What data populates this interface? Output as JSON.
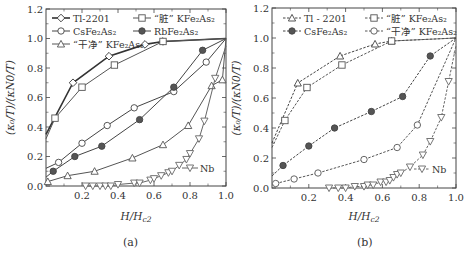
{
  "chart_data": [
    {
      "panel": "(a)",
      "type": "line",
      "line_style": "solid",
      "xlabel": "H/H_c2",
      "ylabel": "(κ0/T)/(κN0/T)",
      "xlim": [
        0,
        1.0
      ],
      "ylim": [
        0,
        1.2
      ],
      "xticks": [
        "0.2",
        "0.4",
        "0.6",
        "0.8",
        "1.0"
      ],
      "yticks": [
        "0.0",
        "0.2",
        "0.4",
        "0.6",
        "0.8",
        "1.0",
        "1.2"
      ],
      "legend_position": "upper left",
      "series": [
        {
          "name": "Tl-2201",
          "marker": "diamond",
          "filled": false,
          "color": "#333333",
          "weight": 1.6,
          "x": [
            0.0,
            0.15,
            0.35,
            0.55,
            0.65,
            1.0
          ],
          "y": [
            0.35,
            0.7,
            0.88,
            0.96,
            0.98,
            1.0
          ]
        },
        {
          "name": "“脏” KFe2As2",
          "marker": "square",
          "filled": false,
          "color": "#555555",
          "weight": 1.0,
          "x": [
            0.0,
            0.05,
            0.2,
            0.38,
            0.65,
            1.0
          ],
          "y": [
            0.32,
            0.46,
            0.67,
            0.82,
            0.98,
            1.0
          ]
        },
        {
          "name": "CsFe2As2",
          "marker": "circle",
          "filled": false,
          "color": "#444444",
          "weight": 1.0,
          "x": [
            0.0,
            0.07,
            0.2,
            0.34,
            0.49,
            0.71,
            0.89,
            1.0
          ],
          "y": [
            0.12,
            0.16,
            0.29,
            0.41,
            0.53,
            0.64,
            0.84,
            1.0
          ]
        },
        {
          "name": "RbFe2As2",
          "marker": "circle",
          "filled": true,
          "color": "#444444",
          "weight": 1.0,
          "x": [
            0.0,
            0.04,
            0.16,
            0.31,
            0.52,
            0.71,
            0.87,
            1.0
          ],
          "y": [
            0.06,
            0.1,
            0.2,
            0.27,
            0.45,
            0.67,
            0.92,
            1.0
          ]
        },
        {
          "name": "“干净” KFe2As2",
          "marker": "triangle-up",
          "filled": false,
          "color": "#555555",
          "weight": 1.0,
          "x": [
            0.0,
            0.01,
            0.12,
            0.27,
            0.48,
            0.65,
            0.79,
            0.92,
            0.98,
            1.0
          ],
          "y": [
            0.02,
            0.03,
            0.07,
            0.1,
            0.19,
            0.28,
            0.41,
            0.68,
            0.72,
            1.0
          ]
        },
        {
          "name": "Nb",
          "marker": "triangle-down",
          "filled": false,
          "color": "#666666",
          "weight": 1.0,
          "x": [
            0.22,
            0.26,
            0.3,
            0.33,
            0.36,
            0.4,
            0.49,
            0.52,
            0.58,
            0.6,
            0.64,
            0.68,
            0.7,
            0.74,
            0.78,
            0.8,
            0.85,
            0.88,
            0.94,
            1.0
          ],
          "y": [
            0.0,
            0.0,
            0.0,
            0.0,
            0.0,
            0.01,
            0.02,
            0.02,
            0.04,
            0.05,
            0.07,
            0.09,
            0.1,
            0.14,
            0.18,
            0.22,
            0.32,
            0.44,
            0.73,
            0.95
          ]
        }
      ],
      "annotations": [
        "Nb"
      ]
    },
    {
      "panel": "(b)",
      "type": "line",
      "line_style": "dashed",
      "xlabel": "H/H_c2",
      "ylabel": "(κ0/T)/(κN0/T)",
      "xlim": [
        0,
        1.0
      ],
      "ylim": [
        0,
        1.2
      ],
      "xticks": [
        "0.2",
        "0.4",
        "0.6",
        "0.8",
        "1.0"
      ],
      "yticks": [
        "0.0",
        "0.2",
        "0.4",
        "0.6",
        "0.8",
        "1.0",
        "1.2"
      ],
      "legend_position": "upper center",
      "series": [
        {
          "name": "Tl - 2201",
          "marker": "triangle-up",
          "filled": false,
          "color": "#444444",
          "x": [
            0.0,
            0.14,
            0.37,
            0.56,
            0.65,
            1.0
          ],
          "y": [
            0.3,
            0.7,
            0.88,
            0.96,
            0.98,
            1.0
          ]
        },
        {
          "name": "“脏” KFe2As2",
          "marker": "square",
          "filled": false,
          "color": "#555555",
          "x": [
            0.0,
            0.07,
            0.19,
            0.38,
            0.65,
            1.0
          ],
          "y": [
            0.27,
            0.45,
            0.67,
            0.82,
            0.98,
            1.0
          ]
        },
        {
          "name": "CsFe2As2",
          "marker": "circle",
          "filled": true,
          "color": "#444444",
          "x": [
            0.0,
            0.06,
            0.2,
            0.34,
            0.54,
            0.71,
            0.86,
            1.0
          ],
          "y": [
            0.08,
            0.15,
            0.28,
            0.4,
            0.51,
            0.61,
            0.88,
            1.0
          ]
        },
        {
          "name": "“干净” KFe2As2",
          "marker": "circle",
          "filled": false,
          "color": "#555555",
          "x": [
            0.0,
            0.02,
            0.12,
            0.25,
            0.5,
            0.68,
            0.79,
            1.0
          ],
          "y": [
            0.02,
            0.03,
            0.06,
            0.1,
            0.19,
            0.27,
            0.42,
            1.0
          ]
        },
        {
          "name": "Nb",
          "marker": "triangle-down",
          "filled": false,
          "color": "#666666",
          "x": [
            0.31,
            0.36,
            0.4,
            0.45,
            0.5,
            0.52,
            0.55,
            0.59,
            0.62,
            0.64,
            0.66,
            0.68,
            0.7,
            0.75,
            0.82,
            0.86,
            0.92,
            0.96,
            1.0
          ],
          "y": [
            0.0,
            0.0,
            0.0,
            0.01,
            0.01,
            0.02,
            0.02,
            0.04,
            0.04,
            0.05,
            0.07,
            0.09,
            0.1,
            0.14,
            0.22,
            0.31,
            0.47,
            0.71,
            0.95
          ]
        }
      ],
      "annotations": [
        "Nb"
      ]
    }
  ],
  "captions": {
    "a": "(a)",
    "b": "(b)"
  },
  "labels": {
    "ylabel": "(κ₀/T)/(κN0/T)",
    "xlabel_main": "H/H",
    "xlabel_sub": "c2"
  }
}
